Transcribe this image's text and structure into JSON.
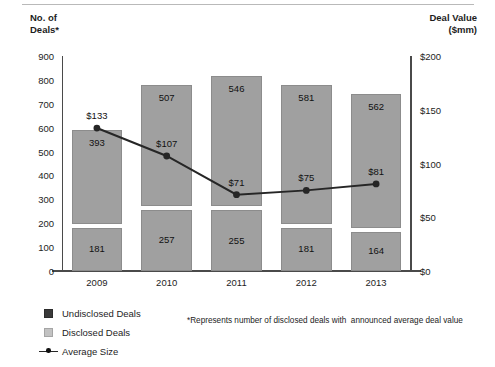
{
  "chart_data": {
    "type": "bar",
    "title": "",
    "subtitle": "",
    "categories": [
      "2009",
      "2010",
      "2011",
      "2012",
      "2013"
    ],
    "stacked": true,
    "series": [
      {
        "name": "Disclosed Deals",
        "axis": "left",
        "values": [
          393,
          507,
          546,
          581,
          562
        ],
        "color": "#a0a0a0"
      },
      {
        "name": "Undisclosed Deals",
        "axis": "left",
        "values": [
          181,
          257,
          255,
          181,
          164
        ],
        "color": "#a0a0a0"
      },
      {
        "name": "Average Size",
        "axis": "right",
        "type": "line",
        "values": [
          133,
          107,
          71,
          75,
          81
        ],
        "labels": [
          "$133",
          "$107",
          "$71",
          "$75",
          "$81"
        ],
        "color": "#262626"
      }
    ],
    "left_axis": {
      "label": "No. of\nDeals*",
      "ticks": [
        0,
        100,
        200,
        300,
        400,
        500,
        600,
        700,
        800,
        900
      ],
      "tick_labels": [
        "0",
        "100",
        "200",
        "300",
        "400",
        "500",
        "600",
        "700",
        "800",
        "900"
      ],
      "ylim": [
        0,
        900
      ]
    },
    "right_axis": {
      "label": "Deal Value\n($mm)",
      "ticks": [
        0,
        50,
        100,
        150,
        200
      ],
      "tick_labels": [
        "$0",
        "$50",
        "$100",
        "$150",
        "$200"
      ],
      "ylim": [
        0,
        200
      ]
    },
    "xlabel": "",
    "grid": false,
    "legend_position": "bottom-left",
    "footnote": "*Represents number of disclosed deals with  announced average deal value"
  },
  "legend": {
    "items": [
      {
        "key": "undisclosed-deals",
        "label": "Undisclosed Deals",
        "marker": "square-dark"
      },
      {
        "key": "disclosed-deals",
        "label": "Disclosed Deals",
        "marker": "square-light"
      },
      {
        "key": "average-size",
        "label": "Average Size",
        "marker": "line-with-dot"
      }
    ]
  },
  "bar_labels": {
    "2009": {
      "disclosed": "393",
      "undisclosed": "181"
    },
    "2010": {
      "disclosed": "507",
      "undisclosed": "257"
    },
    "2011": {
      "disclosed": "546",
      "undisclosed": "255"
    },
    "2012": {
      "disclosed": "581",
      "undisclosed": "181"
    },
    "2013": {
      "disclosed": "562",
      "undisclosed": "164"
    }
  }
}
